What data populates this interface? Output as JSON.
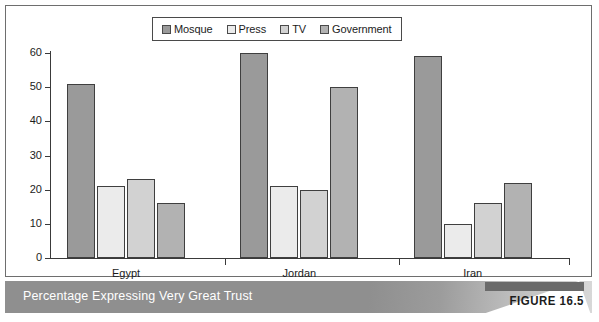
{
  "figure": {
    "caption": "Percentage Expressing Very Great Trust",
    "tag": "FIGURE 16.5"
  },
  "legend": {
    "entries": [
      {
        "label": "Mosque",
        "color": "#9a9a9a"
      },
      {
        "label": "Press",
        "color": "#ebebeb"
      },
      {
        "label": "TV",
        "color": "#d2d2d2"
      },
      {
        "label": "Government",
        "color": "#b2b2b2"
      }
    ]
  },
  "axis": {
    "y_ticks": [
      "0",
      "10",
      "20",
      "30",
      "40",
      "50",
      "60"
    ]
  },
  "chart_data": {
    "type": "bar",
    "title": "Percentage Expressing Very Great Trust",
    "xlabel": "",
    "ylabel": "",
    "ylim": [
      0,
      60
    ],
    "yticks": [
      0,
      10,
      20,
      30,
      40,
      50,
      60
    ],
    "grid": false,
    "legend_position": "top-center",
    "categories": [
      "Egypt",
      "Jordan",
      "Iran"
    ],
    "series": [
      {
        "name": "Mosque",
        "color": "#9a9a9a",
        "values": [
          51,
          60,
          59
        ]
      },
      {
        "name": "Press",
        "color": "#ebebeb",
        "values": [
          21,
          21,
          10
        ]
      },
      {
        "name": "TV",
        "color": "#d2d2d2",
        "values": [
          23,
          20,
          16
        ]
      },
      {
        "name": "Government",
        "color": "#b2b2b2",
        "values": [
          16,
          50,
          22
        ]
      }
    ]
  }
}
